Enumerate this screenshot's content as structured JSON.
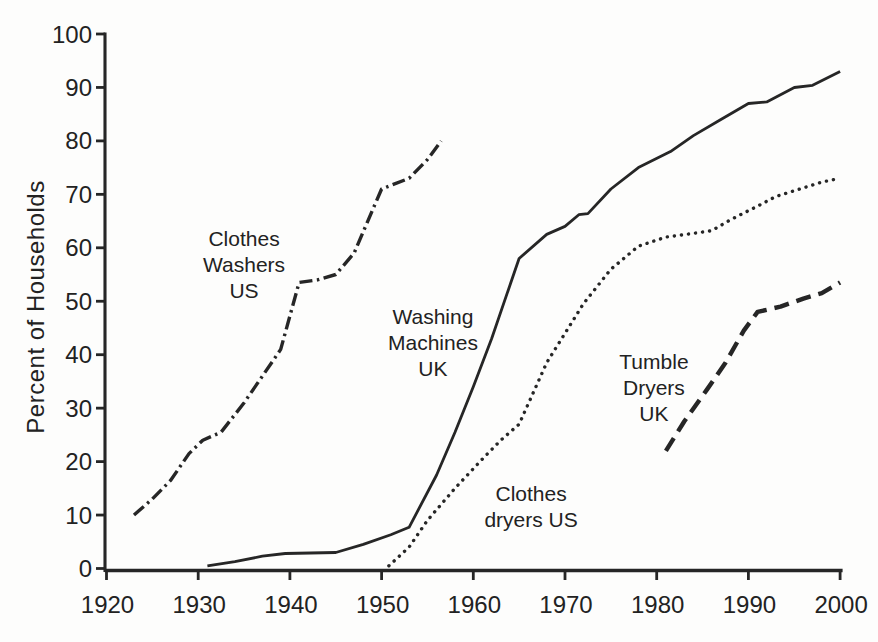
{
  "chart_data": {
    "type": "line",
    "title": "",
    "xlabel": "",
    "ylabel": "Percent of Households",
    "xlim": [
      1920,
      2000
    ],
    "ylim": [
      0,
      100
    ],
    "xticks": [
      1920,
      1930,
      1940,
      1950,
      1960,
      1970,
      1980,
      1990,
      2000
    ],
    "yticks": [
      0,
      10,
      20,
      30,
      40,
      50,
      60,
      70,
      80,
      90,
      100
    ],
    "grid": false,
    "legend_position": "inline-annotations",
    "ink_color": "#262626",
    "series": [
      {
        "name": "Clothes Washers US",
        "style": "dashdot",
        "points": [
          [
            1923,
            10
          ],
          [
            1925,
            13
          ],
          [
            1927,
            16.5
          ],
          [
            1929,
            21.5
          ],
          [
            1930.5,
            24
          ],
          [
            1932.5,
            25.5
          ],
          [
            1935,
            31
          ],
          [
            1937,
            36
          ],
          [
            1939,
            41
          ],
          [
            1941,
            53.5
          ],
          [
            1943,
            54
          ],
          [
            1945,
            55
          ],
          [
            1947,
            59
          ],
          [
            1949,
            67
          ],
          [
            1950,
            71
          ],
          [
            1953,
            73
          ],
          [
            1955,
            76.5
          ],
          [
            1956.5,
            80
          ]
        ],
        "annotation": {
          "lines": [
            "Clothes",
            "Washers",
            "US"
          ],
          "x": 1935,
          "y": 57
        }
      },
      {
        "name": "Washing Machines UK",
        "style": "solid",
        "points": [
          [
            1931,
            0.5
          ],
          [
            1934,
            1.3
          ],
          [
            1937,
            2.3
          ],
          [
            1939.5,
            2.8
          ],
          [
            1945,
            3
          ],
          [
            1948,
            4.5
          ],
          [
            1951,
            6.3
          ],
          [
            1953,
            7.7
          ],
          [
            1956,
            17.5
          ],
          [
            1958,
            25.5
          ],
          [
            1960,
            34
          ],
          [
            1962,
            43
          ],
          [
            1965,
            58
          ],
          [
            1968,
            62.5
          ],
          [
            1970,
            64
          ],
          [
            1971.5,
            66.2
          ],
          [
            1972.5,
            66.4
          ],
          [
            1975,
            71
          ],
          [
            1978,
            75
          ],
          [
            1981.5,
            78
          ],
          [
            1984,
            81
          ],
          [
            1987,
            84
          ],
          [
            1990,
            87
          ],
          [
            1992,
            87.3
          ],
          [
            1995,
            90
          ],
          [
            1997,
            90.4
          ],
          [
            2000,
            93
          ]
        ],
        "annotation": {
          "lines": [
            "Washing",
            "Machines",
            "UK"
          ],
          "x": 1955.6,
          "y": 42.3
        }
      },
      {
        "name": "Clothes dryers US",
        "style": "dotted",
        "points": [
          [
            1950.8,
            0.5
          ],
          [
            1953,
            4
          ],
          [
            1955,
            9
          ],
          [
            1958,
            15
          ],
          [
            1961,
            20.5
          ],
          [
            1963,
            24
          ],
          [
            1965,
            27
          ],
          [
            1968,
            38.5
          ],
          [
            1970,
            44
          ],
          [
            1972,
            49.5
          ],
          [
            1975,
            56
          ],
          [
            1978,
            60.3
          ],
          [
            1981,
            62
          ],
          [
            1984,
            62.7
          ],
          [
            1986,
            63.2
          ],
          [
            1988,
            65.2
          ],
          [
            1991,
            67.8
          ],
          [
            1993,
            69.6
          ],
          [
            1996,
            71.2
          ],
          [
            1998,
            72.3
          ],
          [
            2000,
            73
          ]
        ],
        "annotation": {
          "lines": [
            "Clothes",
            "dryers US"
          ],
          "x": 1966.3,
          "y": 11.7
        }
      },
      {
        "name": "Tumble Dryers UK",
        "style": "dashed",
        "points": [
          [
            1981,
            22
          ],
          [
            1983,
            27.5
          ],
          [
            1985.5,
            33.5
          ],
          [
            1987.5,
            38.5
          ],
          [
            1989.5,
            44.5
          ],
          [
            1991,
            48
          ],
          [
            1993.5,
            49
          ],
          [
            1996,
            50.5
          ],
          [
            1998,
            51.5
          ],
          [
            2000,
            53.5
          ]
        ],
        "annotation": {
          "lines": [
            "Tumble",
            "Dryers",
            "UK"
          ],
          "x": 1979.7,
          "y": 34
        }
      }
    ]
  }
}
